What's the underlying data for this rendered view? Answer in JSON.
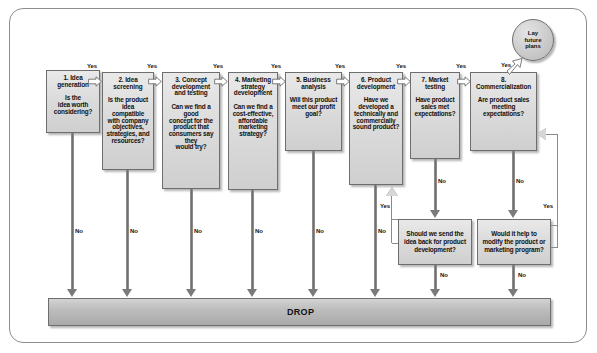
{
  "diagram": {
    "drop_label": "DROP",
    "circle_label_line1": "Lay",
    "circle_label_line2": "future",
    "circle_label_line3": "plans",
    "yes_label": "Yes",
    "no_label": "No",
    "colors": {
      "box_fill": "#dcdcdc",
      "box_border": "#6e6e6e",
      "bar_fill": "#bdbdbd",
      "frame_border": "#8d8d8d",
      "text": "#111111"
    },
    "stages": [
      {
        "id": "stage-1",
        "number": "1.",
        "title": "1. Idea\ngeneration",
        "question": "Is the\nidea worth\nconsidering?"
      },
      {
        "id": "stage-2",
        "number": "2.",
        "title": "2. Idea screening",
        "question": "Is the product\nidea compatible\nwith company\nobjectives,\nstrategies, and\nresources?"
      },
      {
        "id": "stage-3",
        "number": "3.",
        "title": "3. Concept\ndevelopment\nand testing",
        "question": "Can we find a good\nconcept for the\nproduct that\nconsumers say they\nwould try?"
      },
      {
        "id": "stage-4",
        "number": "4.",
        "title": "4. Marketing\nstrategy\ndevelopment",
        "question": "Can we find a\ncost-effective,\naffordable\nmarketing\nstrategy?"
      },
      {
        "id": "stage-5",
        "number": "5.",
        "title": "5. Business analysis",
        "question": "Will this product\nmeet our profit\ngoal?"
      },
      {
        "id": "stage-6",
        "number": "6.",
        "title": "6. Product\ndevelopment",
        "question": "Have we\ndeveloped a\ntechnically and\ncommercially\nsound product?"
      },
      {
        "id": "stage-7",
        "number": "7.",
        "title": "7. Market\ntesting",
        "question": "Have product\nsales met\nexpectations?"
      },
      {
        "id": "stage-8",
        "number": "8.",
        "title": "8. Commercialization",
        "question": "Are product sales\nmeeting\nexpectations?"
      }
    ],
    "feedback_boxes": [
      {
        "id": "feedback-1",
        "text": "Should we send the\nidea back for product\ndevelopment?"
      },
      {
        "id": "feedback-2",
        "text": "Would it help to\nmodify the product or\nmarketing program?"
      }
    ]
  }
}
